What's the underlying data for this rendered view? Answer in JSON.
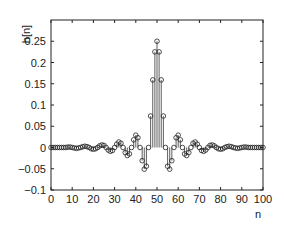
{
  "chart_data": {
    "type": "stem",
    "title": "",
    "xlabel": "n",
    "ylabel": "h[n]",
    "xlim": [
      0,
      100
    ],
    "ylim": [
      -0.1,
      0.3
    ],
    "xticks": [
      0,
      10,
      20,
      30,
      40,
      50,
      60,
      70,
      80,
      90,
      100
    ],
    "xtick_labels": [
      "0",
      "10",
      "20",
      "30",
      "40",
      "50",
      "60",
      "70",
      "80",
      "90",
      "100"
    ],
    "yticks": [
      -0.1,
      -0.05,
      0,
      0.05,
      0.1,
      0.15,
      0.2,
      0.25
    ],
    "ytick_labels": [
      "−0.1",
      "−0.05",
      "0",
      "0.05",
      "0.1",
      "0.15",
      "0.2",
      "0.25"
    ],
    "grid": false,
    "legend": null,
    "marker": "open-circle",
    "colors": {
      "axis": "#222222",
      "stem": "#333333",
      "marker": "#222222"
    },
    "x": [
      0,
      1,
      2,
      3,
      4,
      5,
      6,
      7,
      8,
      9,
      10,
      11,
      12,
      13,
      14,
      15,
      16,
      17,
      18,
      19,
      20,
      21,
      22,
      23,
      24,
      25,
      26,
      27,
      28,
      29,
      30,
      31,
      32,
      33,
      34,
      35,
      36,
      37,
      38,
      39,
      40,
      41,
      42,
      43,
      44,
      45,
      46,
      47,
      48,
      49,
      50,
      51,
      52,
      53,
      54,
      55,
      56,
      57,
      58,
      59,
      60,
      61,
      62,
      63,
      64,
      65,
      66,
      67,
      68,
      69,
      70,
      71,
      72,
      73,
      74,
      75,
      76,
      77,
      78,
      79,
      80,
      81,
      82,
      83,
      84,
      85,
      86,
      87,
      88,
      89,
      90,
      91,
      92,
      93,
      94,
      95,
      96,
      97,
      98,
      99,
      100
    ],
    "values": [
      0,
      0,
      0,
      0,
      0,
      0,
      0,
      0,
      0.001,
      0.001,
      0,
      -0.001,
      -0.002,
      -0.001,
      0,
      0.002,
      0.003,
      0.002,
      0,
      -0.003,
      -0.004,
      -0.003,
      0,
      0.004,
      0.006,
      0.005,
      0,
      -0.006,
      -0.009,
      -0.007,
      0,
      0.008,
      0.013,
      0.01,
      0,
      -0.012,
      -0.019,
      -0.015,
      0,
      0.018,
      0.029,
      0.023,
      0,
      -0.031,
      -0.051,
      -0.044,
      0,
      0.074,
      0.159,
      0.225,
      0.25,
      0.225,
      0.159,
      0.074,
      0,
      -0.044,
      -0.051,
      -0.031,
      0,
      0.023,
      0.029,
      0.018,
      0,
      -0.015,
      -0.019,
      -0.012,
      0,
      0.01,
      0.013,
      0.008,
      0,
      -0.007,
      -0.009,
      -0.006,
      0,
      0.005,
      0.006,
      0.004,
      0,
      -0.003,
      -0.004,
      -0.003,
      0,
      0.002,
      0.003,
      0.002,
      0,
      -0.001,
      -0.002,
      -0.001,
      0,
      0.001,
      0.001,
      0,
      0,
      0,
      0,
      0,
      0,
      0,
      0
    ]
  }
}
